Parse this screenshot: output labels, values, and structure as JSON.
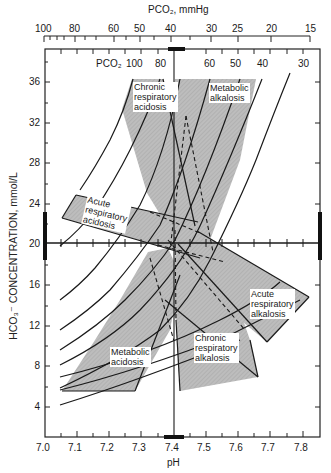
{
  "figure": {
    "type": "acid-base nomogram",
    "top_axis": {
      "title": "PCO₂, mmHg",
      "ticks": [
        "100",
        "80",
        "60",
        "50",
        "40",
        "30",
        "25",
        "20",
        "15"
      ]
    },
    "inner_pco2_label": "PCO₂",
    "inner_isobar_labels": [
      "100",
      "80",
      "60",
      "50",
      "40",
      "30"
    ],
    "y_axis": {
      "title": "HCO₃⁻ CONCENTRATION, mmol/L",
      "ticks": [
        "4",
        "8",
        "12",
        "16",
        "20",
        "24",
        "28",
        "32",
        "36",
        "40",
        "44"
      ]
    },
    "x_axis": {
      "title": "pH",
      "ticks": [
        "7.0",
        "7.1",
        "7.2",
        "7.3",
        "7.4",
        "7.5",
        "7.6",
        "7.7",
        "7.8"
      ]
    },
    "regions": [
      {
        "id": "chronic-respiratory-acidosis",
        "label": "Chronic\nrespiratory\nacidosis"
      },
      {
        "id": "metabolic-alkalosis",
        "label": "Metabolic\nalkalosis"
      },
      {
        "id": "acute-respiratory-acidosis",
        "label": "Acute\nrespiratory\nacidosis"
      },
      {
        "id": "acute-respiratory-alkalosis",
        "label": "Acute\nrespiratory\nalkalosis"
      },
      {
        "id": "metabolic-acidosis",
        "label": "Metabolic\nacidosis"
      },
      {
        "id": "chronic-respiratory-alkalosis",
        "label": "Chronic\nrespiratory\nalkalosis"
      }
    ],
    "normal_ranges": {
      "pH": "7.37–7.43",
      "HCO3": "22–28 mmol/L",
      "PCO2": "36–44 mmHg"
    },
    "colors": {
      "shade": "#b9b9b9",
      "line": "#1a1a1a",
      "background": "#ffffff"
    }
  }
}
